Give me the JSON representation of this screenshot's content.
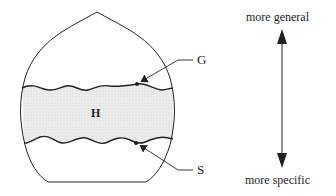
{
  "diagram": {
    "region_label": "H",
    "upper_boundary_label": "G",
    "lower_boundary_label": "S",
    "axis": {
      "top_label": "more general",
      "bottom_label": "more specific"
    }
  },
  "colors": {
    "line": "#222222",
    "band_fill": "#e8e8e8",
    "background": "#ffffff"
  }
}
